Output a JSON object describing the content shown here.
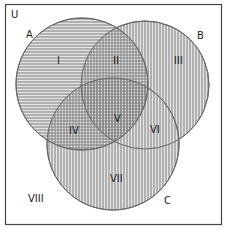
{
  "diagram": {
    "type": "venn",
    "universe_label": "U",
    "sets": [
      {
        "id": "A",
        "label": "A",
        "hatch": "horizontal"
      },
      {
        "id": "B",
        "label": "B",
        "hatch": "vertical"
      },
      {
        "id": "C",
        "label": "C",
        "hatch": "vertical"
      }
    ],
    "regions": [
      {
        "id": "I",
        "label": "I",
        "membership": "A only"
      },
      {
        "id": "II",
        "label": "II",
        "membership": "A and B only"
      },
      {
        "id": "III",
        "label": "III",
        "membership": "B only"
      },
      {
        "id": "IV",
        "label": "IV",
        "membership": "A and C only"
      },
      {
        "id": "V",
        "label": "V",
        "membership": "A, B and C"
      },
      {
        "id": "VI",
        "label": "VI",
        "membership": "B and C only"
      },
      {
        "id": "VII",
        "label": "VII",
        "membership": "C only"
      },
      {
        "id": "VIII",
        "label": "VIII",
        "membership": "outside A, B, C"
      }
    ]
  },
  "colors": {
    "frame": "#444444",
    "circle_stroke": "#666666",
    "hatch_line": "#8a8a8a",
    "fill_bg": "#e2e2e2",
    "text": "#222222"
  }
}
